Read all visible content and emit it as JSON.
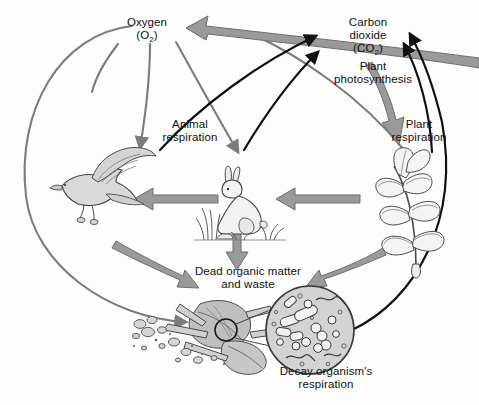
{
  "diagram": {
    "background_color": "#fdfdfd",
    "colors": {
      "oxygen_arrow": "#7c7c7c",
      "carbon_dioxide_arrow": "#111111",
      "matter_arrow_fill": "#9a9a9a",
      "matter_arrow_stroke": "#6d6d6d",
      "organism_fill": "#d9d9d9",
      "organism_stroke": "#4a4a4a",
      "text": "#111111"
    },
    "labels": {
      "oxygen": {
        "line1": "Oxygen",
        "line2_pre": "(O",
        "line2_sub": "2",
        "line2_post": ")"
      },
      "carbon_dioxide": {
        "line1": "Carbon",
        "line2": "dioxide",
        "line3_pre": "(CO",
        "line3_sub": "2",
        "line3_post": ")"
      },
      "plant_photosynthesis": {
        "line1": "Plant",
        "line2": "photosynthesis"
      },
      "plant_respiration": {
        "line1": "Plant",
        "line2": "respiration"
      },
      "animal_respiration": {
        "line1": "Animal",
        "line2": "respiration"
      },
      "dead_organic_matter": {
        "line1": "Dead organic matter",
        "line2": "and waste"
      },
      "decay_respiration": {
        "line1": "Decay organism's",
        "line2": "respiration"
      }
    },
    "organisms": [
      {
        "name": "hawk",
        "role": "secondary consumer",
        "position": "left"
      },
      {
        "name": "rabbit",
        "role": "primary consumer",
        "position": "center"
      },
      {
        "name": "plant",
        "role": "producer",
        "position": "right"
      },
      {
        "name": "dead-leaves",
        "role": "dead organic matter and waste",
        "position": "bottom-center"
      },
      {
        "name": "decay-organisms",
        "role": "decomposers shown magnified",
        "position": "bottom-right"
      }
    ],
    "flows": [
      {
        "id": "o2-to-hawk",
        "type": "oxygen",
        "from": "Oxygen (O2)",
        "to": "hawk"
      },
      {
        "id": "o2-to-rabbit",
        "type": "oxygen",
        "from": "Oxygen (O2)",
        "to": "rabbit"
      },
      {
        "id": "o2-to-decay",
        "type": "oxygen",
        "from": "Oxygen (O2)",
        "to": "dead organic matter"
      },
      {
        "id": "o2-to-plant",
        "type": "oxygen",
        "from": "Oxygen (O2)",
        "to": "plant"
      },
      {
        "id": "plant-to-o2",
        "type": "oxygen",
        "from": "plant",
        "to": "Oxygen (O2)"
      },
      {
        "id": "hawk-to-co2",
        "type": "carbon-dioxide",
        "from": "hawk",
        "to": "Carbon dioxide (CO2)"
      },
      {
        "id": "rabbit-to-co2",
        "type": "carbon-dioxide",
        "from": "rabbit",
        "to": "Carbon dioxide (CO2)"
      },
      {
        "id": "plant-to-co2",
        "type": "carbon-dioxide",
        "from": "plant",
        "to": "Carbon dioxide (CO2)"
      },
      {
        "id": "decay-to-co2",
        "type": "carbon-dioxide",
        "from": "decay organisms",
        "to": "Carbon dioxide (CO2)"
      },
      {
        "id": "co2-to-plant",
        "type": "matter",
        "from": "Carbon dioxide (CO2)",
        "to": "plant"
      },
      {
        "id": "plant-to-rabbit",
        "type": "matter",
        "from": "plant",
        "to": "rabbit"
      },
      {
        "id": "rabbit-to-hawk",
        "type": "matter",
        "from": "rabbit",
        "to": "hawk"
      },
      {
        "id": "rabbit-to-dead",
        "type": "matter",
        "from": "rabbit",
        "to": "dead organic matter"
      },
      {
        "id": "hawk-to-dead",
        "type": "matter",
        "from": "hawk",
        "to": "dead organic matter"
      },
      {
        "id": "plant-to-dead",
        "type": "matter",
        "from": "plant",
        "to": "dead organic matter"
      }
    ]
  }
}
